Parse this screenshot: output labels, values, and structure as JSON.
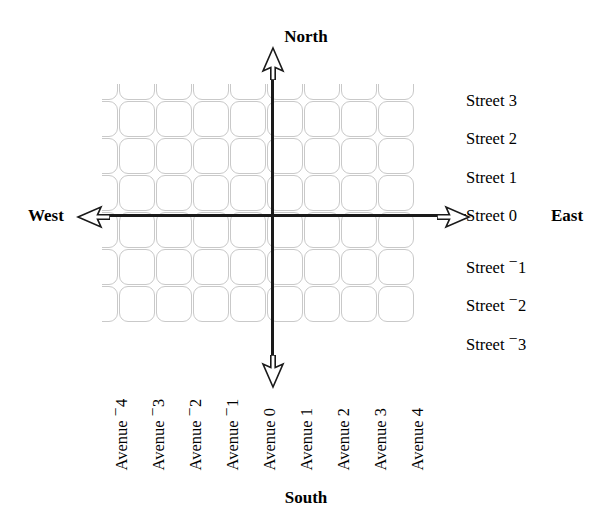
{
  "diagram": {
    "type": "cartesian-street-grid"
  },
  "compass": {
    "north": "North",
    "south": "South",
    "east": "East",
    "west": "West"
  },
  "streets": {
    "prefix": "Street",
    "items": [
      {
        "label": "Street 3",
        "name": "Street",
        "value": 3,
        "sign": "",
        "magnitude": "3",
        "y": 93
      },
      {
        "label": "Street 2",
        "name": "Street",
        "value": 2,
        "sign": "",
        "magnitude": "2",
        "y": 131
      },
      {
        "label": "Street 1",
        "name": "Street",
        "value": 1,
        "sign": "",
        "magnitude": "1",
        "y": 170
      },
      {
        "label": "Street 0",
        "name": "Street",
        "value": 0,
        "sign": "",
        "magnitude": "0",
        "y": 208
      },
      {
        "label": "Street -1",
        "name": "Street",
        "value": -1,
        "sign": "−",
        "magnitude": "1",
        "y": 254
      },
      {
        "label": "Street -2",
        "name": "Street",
        "value": -2,
        "sign": "−",
        "magnitude": "2",
        "y": 292
      },
      {
        "label": "Street -3",
        "name": "Street",
        "value": -3,
        "sign": "−",
        "magnitude": "3",
        "y": 331
      }
    ]
  },
  "avenues": {
    "prefix": "Avenue",
    "items": [
      {
        "label": "Avenue -4",
        "name": "Avenue",
        "value": -4,
        "sign": "−",
        "magnitude": "4",
        "x": 124
      },
      {
        "label": "Avenue -3",
        "name": "Avenue",
        "value": -3,
        "sign": "−",
        "magnitude": "3",
        "x": 161
      },
      {
        "label": "Avenue -2",
        "name": "Avenue",
        "value": -2,
        "sign": "−",
        "magnitude": "2",
        "x": 198
      },
      {
        "label": "Avenue -1",
        "name": "Avenue",
        "value": -1,
        "sign": "−",
        "magnitude": "1",
        "x": 235
      },
      {
        "label": "Avenue 0",
        "name": "Avenue",
        "value": 0,
        "sign": "",
        "magnitude": "0",
        "x": 272
      },
      {
        "label": "Avenue 1",
        "name": "Avenue",
        "value": 1,
        "sign": "",
        "magnitude": "1",
        "x": 309
      },
      {
        "label": "Avenue 2",
        "name": "Avenue",
        "value": 2,
        "sign": "",
        "magnitude": "2",
        "x": 346
      },
      {
        "label": "Avenue 3",
        "name": "Avenue",
        "value": 3,
        "sign": "",
        "magnitude": "3",
        "x": 383
      },
      {
        "label": "Avenue 4",
        "name": "Avenue",
        "value": 4,
        "sign": "",
        "magnitude": "4",
        "x": 420
      }
    ]
  },
  "grid": {
    "columns": 9,
    "rows": 7,
    "block_color": "#c9c9c9",
    "axis_color": "#1a1a1a",
    "origin": {
      "street": 0,
      "avenue": 0
    }
  }
}
